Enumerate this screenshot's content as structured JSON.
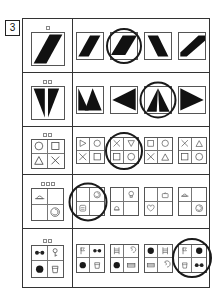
{
  "test": {
    "item_number": "3",
    "kind": "visual-pattern-matrix",
    "colors": {
      "ink": "#1a1a1a",
      "frame": "#333333",
      "figure_border": "#555555",
      "fill": "#111111",
      "paper": "#ffffff",
      "circle_mark": "#1a1a1a"
    },
    "rows": [
      {
        "id": "row-1",
        "tick_count": 1,
        "stem": {
          "name": "diagonal-band-stem",
          "shape": "band-up-right"
        },
        "options": [
          {
            "name": "option-1",
            "shape": "band-up-right",
            "selected": false
          },
          {
            "name": "option-2",
            "shape": "band-up-right-wide",
            "selected": true
          },
          {
            "name": "option-3",
            "shape": "band-down-right",
            "selected": false
          },
          {
            "name": "option-4",
            "shape": "band-up-right-thick",
            "selected": false
          }
        ]
      },
      {
        "id": "row-2",
        "tick_count": 2,
        "stem": {
          "name": "split-triangle-stem",
          "shape": "double-triangle-down"
        },
        "options": [
          {
            "name": "option-1",
            "shape": "triangle-pair-up",
            "selected": false
          },
          {
            "name": "option-2",
            "shape": "triangle-left",
            "selected": false
          },
          {
            "name": "option-3",
            "shape": "triangle-split-vertical",
            "selected": true
          },
          {
            "name": "option-4",
            "shape": "triangle-right",
            "selected": false
          }
        ]
      },
      {
        "id": "row-3",
        "tick_count": 2,
        "stem": {
          "name": "symbol-grid-stem",
          "cells": [
            "circle",
            "square",
            "triangle-up",
            "cross"
          ]
        },
        "options": [
          {
            "name": "option-1",
            "cells": [
              "triangle-right",
              "circle",
              "cross",
              "square"
            ],
            "selected": false
          },
          {
            "name": "option-2",
            "cells": [
              "cross",
              "triangle-down",
              "square",
              "circle"
            ],
            "selected": true
          },
          {
            "name": "option-3",
            "cells": [
              "square",
              "circle",
              "cross",
              "triangle-up"
            ],
            "selected": false
          },
          {
            "name": "option-4",
            "cells": [
              "cross",
              "triangle-up",
              "square",
              "circle"
            ],
            "selected": false
          }
        ]
      },
      {
        "id": "row-4",
        "tick_count": 3,
        "stem": {
          "name": "pictogram-grid-stem",
          "cells": [
            "hat",
            "blank",
            "blank",
            "swirl"
          ]
        },
        "options": [
          {
            "name": "option-1",
            "cells": [
              "blank",
              "swirl",
              "scroll",
              "blank"
            ],
            "selected": true
          },
          {
            "name": "option-2",
            "cells": [
              "blank",
              "lamp",
              "bell",
              "blank"
            ],
            "selected": false
          },
          {
            "name": "option-3",
            "cells": [
              "blank",
              "bag",
              "heart",
              "blank"
            ],
            "selected": false
          },
          {
            "name": "option-4",
            "cells": [
              "hat",
              "blank",
              "blank",
              "swirl"
            ],
            "selected": false
          }
        ]
      },
      {
        "id": "row-5",
        "tick_count": 2,
        "stem": {
          "name": "object-grid-stem",
          "cells": [
            "glasses",
            "key",
            "disc",
            "cup"
          ]
        },
        "options": [
          {
            "name": "option-1",
            "cells": [
              "flag",
              "glasses",
              "disc",
              "cup"
            ],
            "selected": false
          },
          {
            "name": "option-2",
            "cells": [
              "ladder",
              "spiral",
              "disc",
              "film"
            ],
            "selected": false
          },
          {
            "name": "option-3",
            "cells": [
              "disc",
              "ladder",
              "film",
              "spiral"
            ],
            "selected": false
          },
          {
            "name": "option-4",
            "cells": [
              "flag",
              "disc",
              "cup",
              "glasses"
            ],
            "selected": true
          }
        ]
      }
    ]
  }
}
